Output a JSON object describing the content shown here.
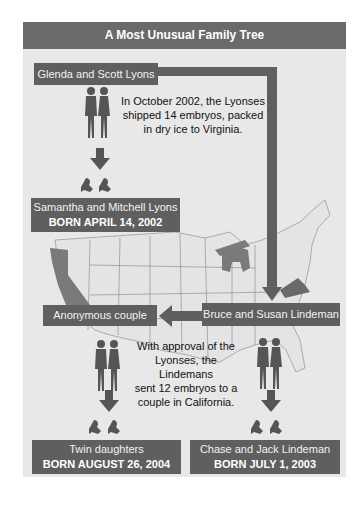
{
  "title": "A Most Unusual Family Tree",
  "colors": {
    "box": "#5f5f5f",
    "header": "#6a6a6a",
    "panel": "#e8e8e8",
    "highlight_state": "#7a7a7a"
  },
  "nodes": {
    "glenda_scott": {
      "label": "Glenda and Scott Lyons"
    },
    "samantha_mitchell": {
      "label": "Samantha and Mitchell Lyons",
      "born": "BORN APRIL 14, 2002"
    },
    "anonymous": {
      "label": "Anonymous couple"
    },
    "bruce_susan": {
      "label": "Bruce and Susan Lindeman"
    },
    "twins": {
      "label": "Twin daughters",
      "born": "BORN AUGUST 26, 2004"
    },
    "chase_jack": {
      "label": "Chase and Jack Lindeman",
      "born": "BORN JULY 1, 2003"
    }
  },
  "captions": {
    "shipment": [
      "In October 2002, the Lyonses",
      "shipped 14 embryos, packed",
      "in dry ice to Virginia."
    ],
    "approval": [
      "With approval of the",
      "Lyonses, the Lindemans",
      "sent 12 embryos to a",
      "couple in California."
    ]
  },
  "map": {
    "highlighted_states": [
      "California",
      "Virginia",
      "Michigan"
    ]
  },
  "icons": [
    "couple-icon",
    "babies-icon",
    "arrow-down-icon",
    "arrow-left-icon",
    "us-map"
  ]
}
